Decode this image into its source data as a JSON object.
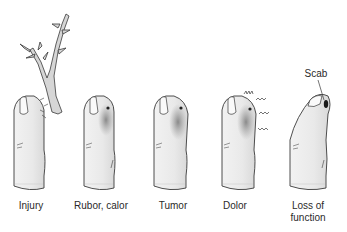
{
  "figure": {
    "panels": [
      {
        "id": "injury",
        "label": "Injury",
        "cx": 31
      },
      {
        "id": "rubor-calor",
        "label": "Rubor, calor",
        "cx": 101
      },
      {
        "id": "tumor",
        "label": "Tumor",
        "cx": 173
      },
      {
        "id": "dolor",
        "label": "Dolor",
        "cx": 235
      },
      {
        "id": "loss-of-function",
        "label_line1": "Loss of",
        "label_line2": "function",
        "cx": 308
      }
    ],
    "annotation": {
      "label": "Scab"
    },
    "colors": {
      "outline": "#3a3a3a",
      "skin": "#ececec",
      "inflamed": "#8a8a8a",
      "branch": "#d4d4d4"
    }
  }
}
